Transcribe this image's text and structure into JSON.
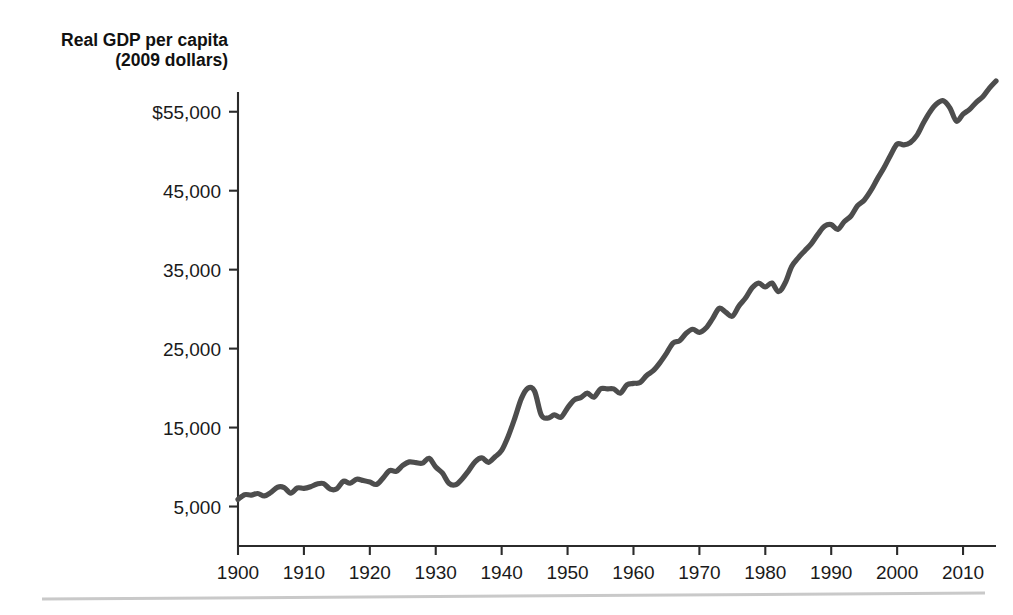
{
  "chart_data": {
    "type": "line",
    "title": "",
    "axis_title_lines": [
      "Real GDP per capita",
      "(2009 dollars)"
    ],
    "xlabel": "",
    "ylabel": "Real GDP per capita (2009 dollars)",
    "grid": false,
    "legend": "none",
    "xlim": [
      1900,
      2015
    ],
    "ylim": [
      0,
      57500
    ],
    "xticks": [
      1900,
      1910,
      1920,
      1930,
      1940,
      1950,
      1960,
      1970,
      1980,
      1990,
      2000,
      2010
    ],
    "xtick_labels": [
      "1900",
      "1910",
      "1920",
      "1930",
      "1940",
      "1950",
      "1960",
      "1970",
      "1980",
      "1990",
      "2000",
      "2010"
    ],
    "yticks": [
      5000,
      15000,
      25000,
      35000,
      45000,
      55000
    ],
    "ytick_labels": [
      "5,000",
      "15,000",
      "25,000",
      "35,000",
      "45,000",
      "$55,000"
    ],
    "series": [
      {
        "name": "Real GDP per capita",
        "color": "#4d4d4d",
        "x": [
          1900,
          1901,
          1902,
          1903,
          1904,
          1905,
          1906,
          1907,
          1908,
          1909,
          1910,
          1911,
          1912,
          1913,
          1914,
          1915,
          1916,
          1917,
          1918,
          1919,
          1920,
          1921,
          1922,
          1923,
          1924,
          1925,
          1926,
          1927,
          1928,
          1929,
          1930,
          1931,
          1932,
          1933,
          1934,
          1935,
          1936,
          1937,
          1938,
          1939,
          1940,
          1941,
          1942,
          1943,
          1944,
          1945,
          1946,
          1947,
          1948,
          1949,
          1950,
          1951,
          1952,
          1953,
          1954,
          1955,
          1956,
          1957,
          1958,
          1959,
          1960,
          1961,
          1962,
          1963,
          1964,
          1965,
          1966,
          1967,
          1968,
          1969,
          1970,
          1971,
          1972,
          1973,
          1974,
          1975,
          1976,
          1977,
          1978,
          1979,
          1980,
          1981,
          1982,
          1983,
          1984,
          1985,
          1986,
          1987,
          1988,
          1989,
          1990,
          1991,
          1992,
          1993,
          1994,
          1995,
          1996,
          1997,
          1998,
          1999,
          2000,
          2001,
          2002,
          2003,
          2004,
          2005,
          2006,
          2007,
          2008,
          2009,
          2010,
          2011,
          2012,
          2013,
          2014,
          2015
        ],
        "y": [
          5900,
          6500,
          6450,
          6650,
          6350,
          6800,
          7450,
          7400,
          6700,
          7350,
          7300,
          7500,
          7850,
          7900,
          7200,
          7250,
          8200,
          7950,
          8450,
          8300,
          8100,
          7800,
          8600,
          9550,
          9450,
          10200,
          10650,
          10550,
          10500,
          11100,
          10000,
          9250,
          7950,
          7750,
          8500,
          9550,
          10700,
          11150,
          10600,
          11300,
          12100,
          13900,
          16200,
          18700,
          20000,
          19600,
          16600,
          16200,
          16600,
          16300,
          17500,
          18500,
          18800,
          19350,
          18850,
          19900,
          19900,
          19900,
          19350,
          20400,
          20600,
          20700,
          21600,
          22200,
          23200,
          24400,
          25700,
          26000,
          26950,
          27450,
          27050,
          27600,
          28800,
          30100,
          29600,
          29100,
          30400,
          31400,
          32700,
          33300,
          32800,
          33300,
          32200,
          33300,
          35400,
          36500,
          37400,
          38300,
          39500,
          40500,
          40700,
          40100,
          41100,
          41800,
          43100,
          43800,
          45000,
          46500,
          47900,
          49500,
          50900,
          50800,
          51100,
          52000,
          53600,
          55000,
          56000,
          56400,
          55500,
          53800,
          54700,
          55300,
          56200,
          56900,
          58000,
          58900
        ]
      }
    ],
    "annotations": []
  },
  "colors": {
    "series_line": "#4d4d4d",
    "axis": "#2b2b2b",
    "text": "#1a1a1a",
    "footer_rule": "#c9c9c9",
    "background": "#ffffff"
  },
  "layout": {
    "plot_left": 238,
    "plot_right": 996,
    "plot_top": 92,
    "plot_bottom": 546,
    "footer_rule_y": 596
  }
}
